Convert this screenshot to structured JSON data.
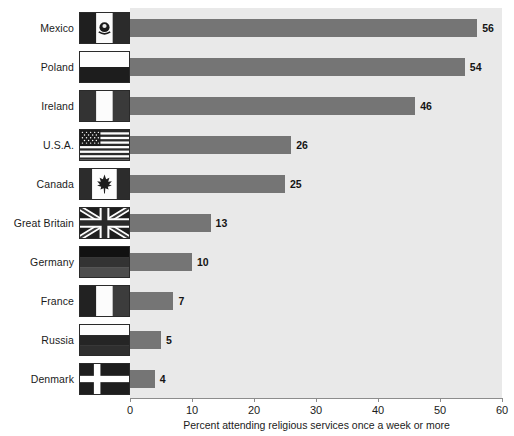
{
  "chart_data": {
    "type": "bar",
    "orientation": "horizontal",
    "title": "",
    "xlabel": "Percent attending religious services once a week or more",
    "ylabel": "",
    "xlim": [
      0,
      60
    ],
    "xticks": [
      0,
      10,
      20,
      30,
      40,
      50,
      60
    ],
    "xtick_labels": [
      "0",
      "10",
      "20",
      "30",
      "40",
      "50",
      "60"
    ],
    "grid": false,
    "legend": "none",
    "categories": [
      "Mexico",
      "Poland",
      "Ireland",
      "U.S.A.",
      "Canada",
      "Great Britain",
      "Germany",
      "France",
      "Russia",
      "Denmark"
    ],
    "values": [
      56,
      54,
      46,
      26,
      25,
      13,
      10,
      7,
      5,
      4
    ],
    "value_labels": [
      "56",
      "54",
      "46",
      "26",
      "25",
      "13",
      "10",
      "7",
      "5",
      "4"
    ],
    "bar_color": "#757575",
    "plot_background": "#e9e9e9",
    "rows": [
      {
        "label": "Mexico",
        "value": 56,
        "value_label": "56",
        "flag": "flag-mexico"
      },
      {
        "label": "Poland",
        "value": 54,
        "value_label": "54",
        "flag": "flag-poland"
      },
      {
        "label": "Ireland",
        "value": 46,
        "value_label": "46",
        "flag": "flag-ireland"
      },
      {
        "label": "U.S.A.",
        "value": 26,
        "value_label": "26",
        "flag": "flag-usa"
      },
      {
        "label": "Canada",
        "value": 25,
        "value_label": "25",
        "flag": "flag-canada"
      },
      {
        "label": "Great Britain",
        "value": 13,
        "value_label": "13",
        "flag": "flag-great-britain"
      },
      {
        "label": "Germany",
        "value": 10,
        "value_label": "10",
        "flag": "flag-germany"
      },
      {
        "label": "France",
        "value": 7,
        "value_label": "7",
        "flag": "flag-france"
      },
      {
        "label": "Russia",
        "value": 5,
        "value_label": "5",
        "flag": "flag-russia"
      },
      {
        "label": "Denmark",
        "value": 4,
        "value_label": "4",
        "flag": "flag-denmark"
      }
    ]
  }
}
